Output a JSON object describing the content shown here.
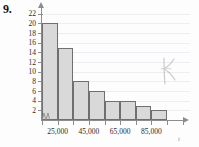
{
  "figure": {
    "problem_number": "9.",
    "x_axis_variable": "t"
  },
  "annotation": {
    "pencil_mark": "R"
  },
  "chart_data": {
    "type": "bar",
    "title": "",
    "xlabel": "",
    "ylabel": "",
    "categories": [
      "15,000",
      "25,000",
      "35,000",
      "45,000",
      "55,000",
      "65,000",
      "75,000",
      "85,000"
    ],
    "values": [
      20,
      15,
      8,
      6,
      4,
      4,
      3,
      2
    ],
    "ylim": [
      0,
      23
    ],
    "y_ticks": [
      2,
      4,
      6,
      8,
      10,
      12,
      14,
      16,
      18,
      20,
      22
    ],
    "y_tick_labels": [
      "2",
      "4",
      "6",
      "8",
      "10",
      "12",
      "14",
      "16",
      "18",
      "20",
      "22"
    ],
    "x_tick_labels": [
      "25,000",
      "45,000",
      "65,000",
      "85,000"
    ],
    "x_tick_label_positions": [
      1,
      3,
      5,
      7
    ],
    "grid": true,
    "legend": "none",
    "bar_fill_color": "#d9d9d9",
    "bar_border_color": "#6f6f6f",
    "axis_color": "#8d8d8d",
    "grid_color": "#ededf2",
    "axis_break": true
  }
}
